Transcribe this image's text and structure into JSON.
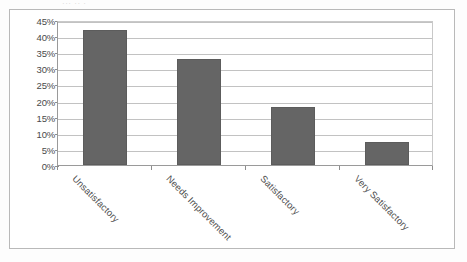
{
  "document": {
    "title_remnant": "··· ·· ·"
  },
  "chart_data": {
    "type": "bar",
    "title": "",
    "xlabel": "",
    "ylabel": "",
    "categories": [
      "Unsatisfactory",
      "Needs Improvement",
      "Satisfactory",
      "Very Satisfactory"
    ],
    "values": [
      42,
      33,
      18,
      7
    ],
    "value_labels": [
      "42%",
      "33%",
      "18%",
      "7%"
    ],
    "ylim": [
      0,
      45
    ],
    "ytick_values": [
      45,
      40,
      35,
      30,
      25,
      20,
      15,
      10,
      5,
      0
    ],
    "ytick_labels": [
      "45%",
      "40%",
      "35%",
      "30%",
      "25%",
      "20%",
      "15%",
      "10%",
      "5%",
      "0%"
    ],
    "grid": true,
    "legend": false,
    "legend_position": "none",
    "bar_color": "#656565",
    "gridline_color": "#c2c2c2",
    "axis_color": "#9a9a9a",
    "label_rotation_deg": 45
  }
}
